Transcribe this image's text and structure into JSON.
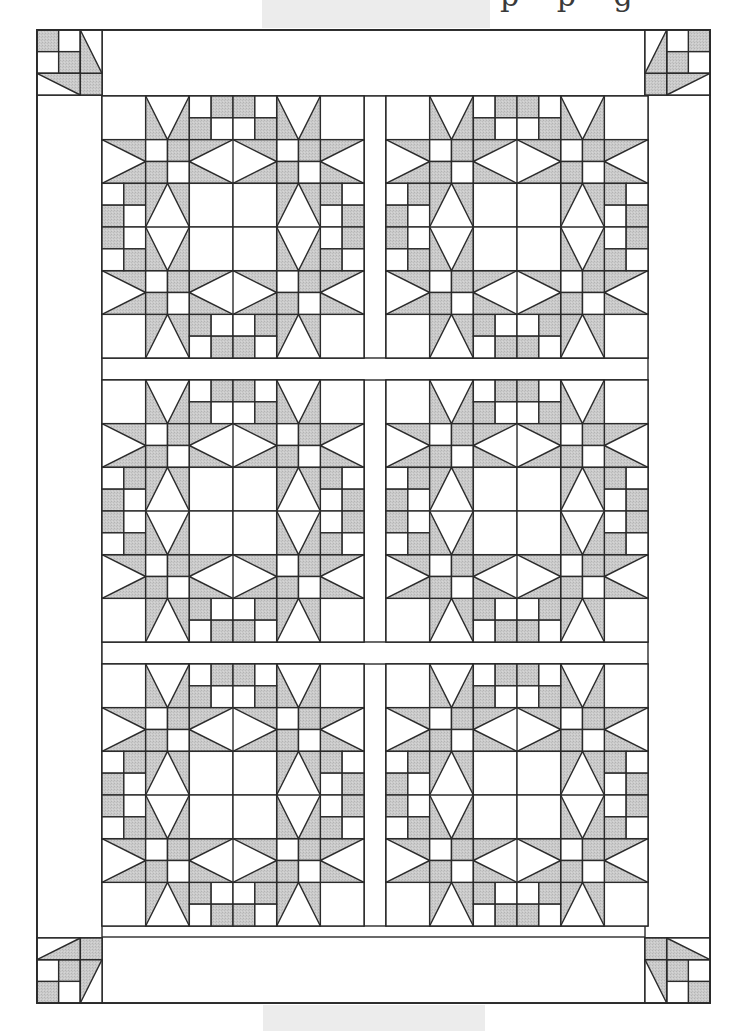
{
  "page": {
    "width": 741,
    "height": 1031,
    "cropped_heading_fragment": "p p g"
  },
  "scan_shading": [
    {
      "x": 262,
      "y": 0,
      "w": 228,
      "h": 28
    },
    {
      "x": 263,
      "y": 1005,
      "w": 222,
      "h": 26
    }
  ],
  "colors": {
    "background": "#ffffff",
    "fabric_dark": "#c9c9c9",
    "fabric_light": "#ffffff",
    "outline": "#2b2b2b",
    "scan_shade": "#ececec"
  },
  "quilt": {
    "title": "Star quilt layout diagram",
    "outer": {
      "x": 37,
      "y": 30,
      "w": 673,
      "h": 973
    },
    "border_width": 65,
    "block_size": 262,
    "sashing_width": 22,
    "block_grid": {
      "rows": 3,
      "cols": 2
    },
    "block_origin": {
      "x": 102,
      "y": 96
    },
    "block_cells": 6,
    "blocks": [
      {
        "row": 0,
        "col": 0,
        "pattern": "star-wreath"
      },
      {
        "row": 0,
        "col": 1,
        "pattern": "star-wreath"
      },
      {
        "row": 1,
        "col": 0,
        "pattern": "star-wreath"
      },
      {
        "row": 1,
        "col": 1,
        "pattern": "star-wreath"
      },
      {
        "row": 2,
        "col": 0,
        "pattern": "star-wreath"
      },
      {
        "row": 2,
        "col": 1,
        "pattern": "star-wreath"
      }
    ],
    "corner_blocks": [
      {
        "position": "top-left",
        "rotation": 0
      },
      {
        "position": "top-right",
        "rotation": 90
      },
      {
        "position": "bottom-right",
        "rotation": 180
      },
      {
        "position": "bottom-left",
        "rotation": 270
      }
    ],
    "block_pattern": {
      "name": "star-wreath",
      "grid": 6,
      "stars": [
        {
          "cx": 1,
          "cy": 1
        },
        {
          "cx": 4,
          "cy": 1
        },
        {
          "cx": 1,
          "cy": 4
        },
        {
          "cx": 4,
          "cy": 4
        }
      ],
      "top_checker": [
        [
          "W",
          "G",
          "G",
          "W"
        ],
        [
          "G",
          "W",
          "W",
          "G"
        ]
      ],
      "bottom_checker": [
        [
          "G",
          "W",
          "W",
          "G"
        ],
        [
          "W",
          "G",
          "G",
          "W"
        ]
      ],
      "left_checker": [
        [
          "W",
          "G"
        ],
        [
          "G",
          "W"
        ],
        [
          "G",
          "W"
        ],
        [
          "W",
          "G"
        ]
      ],
      "right_checker": [
        [
          "G",
          "W"
        ],
        [
          "W",
          "G"
        ],
        [
          "W",
          "G"
        ],
        [
          "G",
          "W"
        ]
      ],
      "star_center_checker": [
        [
          "W",
          "G"
        ],
        [
          "G",
          "W"
        ]
      ],
      "center_squares": 4
    }
  }
}
